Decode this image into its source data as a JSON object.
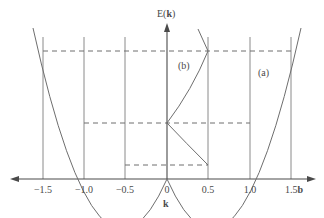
{
  "diagram": {
    "y_axis_label_prefix": "E(",
    "y_axis_label_bold": "k",
    "y_axis_label_suffix": ")",
    "x_axis_label": "k",
    "tick_labels": [
      "−1.5",
      "−1.0",
      "−0.5",
      "0",
      "0.5",
      "1.0",
      "1.5"
    ],
    "tick_unit_label": "b",
    "curve_labels": {
      "a": "(a)",
      "b": "(b)"
    },
    "tick_values": [
      -1.5,
      -1.0,
      -0.5,
      0,
      0.5,
      1.0,
      1.5
    ],
    "energy_levels_dashed": [
      0.25,
      1.0,
      2.25
    ],
    "colors": {
      "line": "#6e6e6e",
      "text": "#4a4a4a",
      "background": "#ffffff"
    }
  }
}
